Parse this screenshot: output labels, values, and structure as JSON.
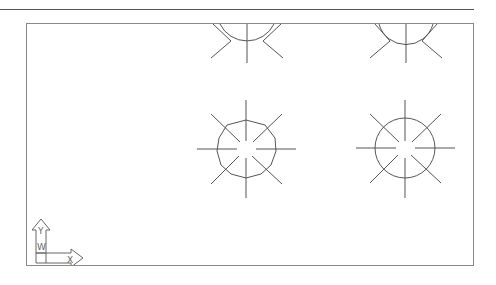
{
  "canvas": {
    "background": "#ffffff",
    "line_color": "#555555",
    "frame_color": "#888888"
  },
  "ucs_icon": {
    "y_label": "Y",
    "x_label": "X",
    "w_label": "W"
  },
  "symbols": [
    {
      "name": "light-fixture-top-left",
      "cx": 246,
      "cy": 22,
      "r": 34,
      "shape": "polygon"
    },
    {
      "name": "light-fixture-top-right",
      "cx": 405,
      "cy": 22,
      "r": 34,
      "shape": "circle"
    },
    {
      "name": "light-fixture-mid-left",
      "cx": 245,
      "cy": 148,
      "r": 30,
      "shape": "polygon"
    },
    {
      "name": "light-fixture-mid-right",
      "cx": 404,
      "cy": 147,
      "r": 30,
      "shape": "circle"
    }
  ]
}
